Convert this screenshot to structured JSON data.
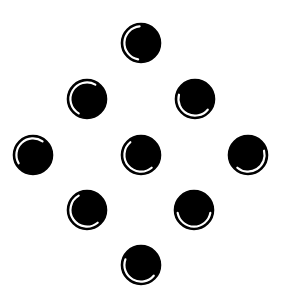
{
  "canvas": {
    "width": 285,
    "height": 306,
    "background": "#ffffff"
  },
  "style": {
    "disc_color": "#000000",
    "ring_color": "#000000",
    "highlight_color": "#ffffff",
    "radius": 19.5,
    "ring_width": 1.6,
    "highlight_radius": 16.6,
    "highlight_width": 2.2
  },
  "circles": [
    {
      "id": "top",
      "cx": 141,
      "cy": 43,
      "arc_from": 190,
      "arc_to": 355
    },
    {
      "id": "upper-left",
      "cx": 87,
      "cy": 99,
      "arc_from": 210,
      "arc_to": 390
    },
    {
      "id": "upper-right",
      "cx": 195,
      "cy": 99,
      "arc_from": 130,
      "arc_to": 285
    },
    {
      "id": "mid-left",
      "cx": 33,
      "cy": 155,
      "arc_from": 240,
      "arc_to": 395
    },
    {
      "id": "centre",
      "cx": 141,
      "cy": 155,
      "arc_from": 140,
      "arc_to": 320
    },
    {
      "id": "mid-right",
      "cx": 248,
      "cy": 155,
      "arc_from": 75,
      "arc_to": 220
    },
    {
      "id": "lower-left",
      "cx": 87,
      "cy": 210,
      "arc_from": 140,
      "arc_to": 330
    },
    {
      "id": "lower-right",
      "cx": 194,
      "cy": 210,
      "arc_from": 100,
      "arc_to": 260
    },
    {
      "id": "bottom",
      "cx": 141,
      "cy": 265,
      "arc_from": 130,
      "arc_to": 290
    }
  ]
}
